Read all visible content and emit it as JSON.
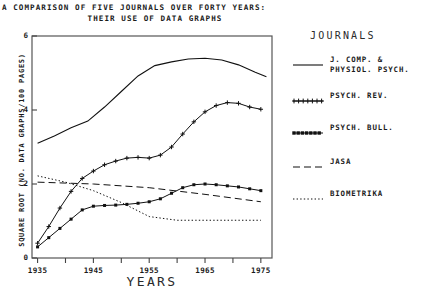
{
  "title": {
    "line1": "A COMPARISON OF FIVE JOURNALS OVER FORTY YEARS:",
    "line2": "THEIR USE OF DATA GRAPHS"
  },
  "legend": {
    "heading": "JOURNALS",
    "entries": [
      {
        "label": "J. COMP. &\nPHYSIOL. PSYCH.",
        "style": "solid",
        "marker": "none"
      },
      {
        "label": "PSYCH. REV.",
        "style": "plus",
        "marker": "plus"
      },
      {
        "label": "PSYCH. BULL.",
        "style": "square",
        "marker": "square"
      },
      {
        "label": "JASA",
        "style": "dashed",
        "marker": "none"
      },
      {
        "label": "BIOMETRIKA",
        "style": "dotted",
        "marker": "none"
      }
    ]
  },
  "chart_data": {
    "type": "line",
    "title": "A COMPARISON OF FIVE JOURNALS OVER FORTY YEARS: THEIR USE OF DATA GRAPHS",
    "xlabel": "YEARS",
    "ylabel": "SQUARE ROOT (NO. DATA GRAPHS/100 PAGES)",
    "xlim": [
      1934,
      1977
    ],
    "ylim": [
      0,
      6
    ],
    "xticks": [
      1935,
      1940,
      1945,
      1950,
      1955,
      1960,
      1965,
      1970,
      1975
    ],
    "xtick_labels": [
      "1935",
      "",
      "1945",
      "",
      "1955",
      "",
      "1965",
      "",
      "1975"
    ],
    "yticks": [
      0,
      2,
      4,
      6
    ],
    "ytick_labels": [
      "0",
      "2",
      "4",
      "6"
    ],
    "grid": false,
    "legend_position": "right",
    "series": [
      {
        "name": "J. COMP. & PHYSIOL. PSYCH.",
        "style": "solid",
        "marker": "none",
        "x": [
          1935,
          1938,
          1941,
          1944,
          1947,
          1950,
          1953,
          1956,
          1959,
          1962,
          1965,
          1968,
          1971,
          1974,
          1976
        ],
        "values": [
          3.1,
          3.3,
          3.52,
          3.7,
          4.08,
          4.5,
          4.92,
          5.2,
          5.3,
          5.38,
          5.4,
          5.35,
          5.22,
          5.02,
          4.9
        ]
      },
      {
        "name": "PSYCH. REV.",
        "style": "plus",
        "marker": "plus",
        "x": [
          1935,
          1937,
          1939,
          1941,
          1943,
          1945,
          1947,
          1949,
          1951,
          1953,
          1955,
          1957,
          1959,
          1961,
          1963,
          1965,
          1967,
          1969,
          1971,
          1973,
          1975
        ],
        "values": [
          0.4,
          0.85,
          1.35,
          1.8,
          2.15,
          2.35,
          2.52,
          2.62,
          2.7,
          2.72,
          2.7,
          2.78,
          3.0,
          3.35,
          3.68,
          3.95,
          4.12,
          4.2,
          4.18,
          4.08,
          4.02
        ]
      },
      {
        "name": "PSYCH. BULL.",
        "style": "square",
        "marker": "square",
        "x": [
          1935,
          1937,
          1939,
          1941,
          1943,
          1945,
          1947,
          1949,
          1951,
          1953,
          1955,
          1957,
          1959,
          1961,
          1963,
          1965,
          1967,
          1969,
          1971,
          1973,
          1975
        ],
        "values": [
          0.3,
          0.55,
          0.8,
          1.05,
          1.3,
          1.4,
          1.42,
          1.43,
          1.45,
          1.48,
          1.52,
          1.6,
          1.75,
          1.9,
          1.98,
          2.0,
          1.98,
          1.95,
          1.92,
          1.87,
          1.82
        ]
      },
      {
        "name": "JASA",
        "style": "dashed",
        "marker": "none",
        "x": [
          1935,
          1945,
          1955,
          1965,
          1975
        ],
        "values": [
          2.05,
          2.0,
          1.9,
          1.72,
          1.52
        ]
      },
      {
        "name": "BIOMETRIKA",
        "style": "dotted",
        "marker": "none",
        "x": [
          1935,
          1940,
          1945,
          1950,
          1955,
          1960,
          1965,
          1970,
          1975
        ],
        "values": [
          2.22,
          2.05,
          1.82,
          1.5,
          1.12,
          1.02,
          1.02,
          1.02,
          1.02
        ]
      }
    ]
  }
}
